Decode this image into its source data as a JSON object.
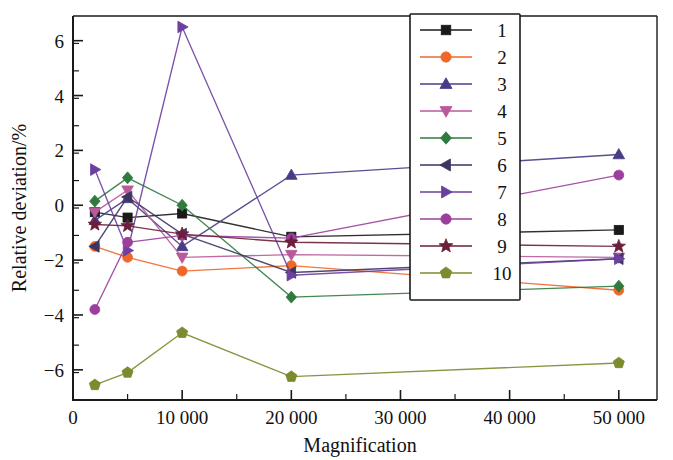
{
  "figure": {
    "title": "",
    "background": "#ffffff"
  },
  "axes": {
    "x": {
      "label": "Magnification",
      "ticks": [
        "0",
        "10 000",
        "20 000",
        "30 000",
        "40 000",
        "50 000"
      ],
      "tick_values": [
        0,
        10000,
        20000,
        30000,
        40000,
        50000
      ],
      "min": 0,
      "max": 53500,
      "minor_per_major": 2
    },
    "y": {
      "label": "Relative deviation/%",
      "ticks": [
        "6",
        "4",
        "2",
        "0",
        "−2",
        "−4",
        "−6"
      ],
      "tick_values": [
        6,
        4,
        2,
        0,
        -2,
        -4,
        -6
      ],
      "min": -7.1,
      "max": 6.9,
      "minor_per_major": 2
    }
  },
  "legend": {
    "position": "top-right-inside",
    "items": [
      {
        "label": "1",
        "marker": "square",
        "color": "#1a1a1a"
      },
      {
        "label": "2",
        "marker": "circle",
        "color": "#f0672a"
      },
      {
        "label": "3",
        "marker": "triangle-up",
        "color": "#4a3b87"
      },
      {
        "label": "4",
        "marker": "triangle-down",
        "color": "#b85a9b"
      },
      {
        "label": "5",
        "marker": "diamond",
        "color": "#2f7a3f"
      },
      {
        "label": "6",
        "marker": "triangle-left",
        "color": "#3b3560"
      },
      {
        "label": "7",
        "marker": "triangle-right",
        "color": "#6d3f9e"
      },
      {
        "label": "8",
        "marker": "circle",
        "color": "#9c3f9c"
      },
      {
        "label": "9",
        "marker": "star",
        "color": "#6b1f3a"
      },
      {
        "label": "10",
        "marker": "pentagon",
        "color": "#7d8a2e"
      }
    ]
  },
  "chart_data": {
    "type": "line",
    "title": "",
    "xlabel": "Magnification",
    "ylabel": "Relative deviation/%",
    "xlim": [
      0,
      53500
    ],
    "ylim": [
      -7.1,
      6.9
    ],
    "grid": false,
    "legend_position": "top-right-inside",
    "x": [
      2000,
      5000,
      10000,
      20000,
      50000
    ],
    "series": [
      {
        "name": "1",
        "marker": "square",
        "color": "#1a1a1a",
        "values": [
          -0.25,
          -0.45,
          -0.3,
          -1.15,
          -0.9
        ]
      },
      {
        "name": "2",
        "marker": "circle",
        "color": "#f0672a",
        "values": [
          -1.5,
          -1.9,
          -2.4,
          -2.2,
          -3.1
        ]
      },
      {
        "name": "3",
        "marker": "triangle-up",
        "color": "#4a3b87",
        "values": [
          -0.55,
          0.25,
          -1.5,
          1.1,
          1.85
        ]
      },
      {
        "name": "4",
        "marker": "triangle-down",
        "color": "#b85a9b",
        "values": [
          -0.25,
          0.55,
          -1.9,
          -1.8,
          -1.9
        ]
      },
      {
        "name": "5",
        "marker": "diamond",
        "color": "#2f7a3f",
        "values": [
          0.15,
          1.0,
          0.0,
          -3.35,
          -2.95
        ]
      },
      {
        "name": "6",
        "marker": "triangle-left",
        "color": "#3b3560",
        "values": [
          -1.5,
          0.3,
          -1.05,
          -2.45,
          -1.95
        ]
      },
      {
        "name": "7",
        "marker": "triangle-right",
        "color": "#6d3f9e",
        "values": [
          1.3,
          -1.65,
          6.5,
          -2.55,
          -1.95
        ]
      },
      {
        "name": "8",
        "marker": "circle",
        "color": "#9c3f9c",
        "values": [
          -3.8,
          -1.35,
          -1.1,
          -1.2,
          1.1
        ]
      },
      {
        "name": "9",
        "marker": "star",
        "color": "#6b1f3a",
        "values": [
          -0.7,
          -0.75,
          -1.05,
          -1.35,
          -1.5
        ]
      },
      {
        "name": "10",
        "marker": "pentagon",
        "color": "#7d8a2e",
        "values": [
          -6.55,
          -6.1,
          -4.65,
          -6.25,
          -5.75
        ]
      }
    ]
  }
}
